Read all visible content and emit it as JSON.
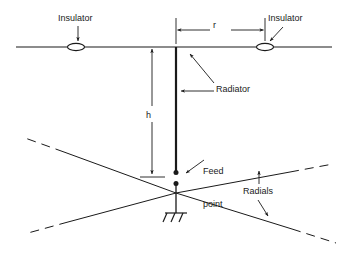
{
  "diagram": {
    "stroke_color": "#1a1a1a",
    "background_color": "#ffffff",
    "labels": {
      "insulator_left": "Insulator",
      "insulator_right": "Insulator",
      "span_r": "r",
      "radiator": "Radiator",
      "height_h": "h",
      "feed_point_line1": "Feed",
      "feed_point_line2": "point",
      "radials": "Radials"
    },
    "elements": {
      "top_wire": {
        "x1": 16,
        "y1": 47,
        "x2": 332,
        "y2": 47
      },
      "insulator_left_ellipse": {
        "cx": 76,
        "cy": 47,
        "rx": 8,
        "ry": 3.5
      },
      "insulator_right_ellipse": {
        "cx": 265,
        "cy": 47,
        "rx": 8,
        "ry": 3.5
      },
      "radiator_mast": {
        "x": 176,
        "y_top": 47,
        "y_bottom": 172
      },
      "feed_dot_upper": {
        "cx": 176,
        "cy": 172,
        "r": 2.4
      },
      "feed_dot_lower": {
        "cx": 176,
        "cy": 183,
        "r": 2.4
      },
      "ground_stem": {
        "x": 176,
        "y_top": 183,
        "y_bottom": 212
      },
      "ground_symbol": {
        "cx": 176,
        "cy": 212
      },
      "dimension_r": {
        "y": 30,
        "x_left": 176,
        "x_right": 265
      },
      "dimension_h": {
        "x": 152,
        "y_top": 47,
        "y_bottom": 176
      },
      "radials_cross_center": {
        "x": 176,
        "y": 193
      }
    }
  }
}
